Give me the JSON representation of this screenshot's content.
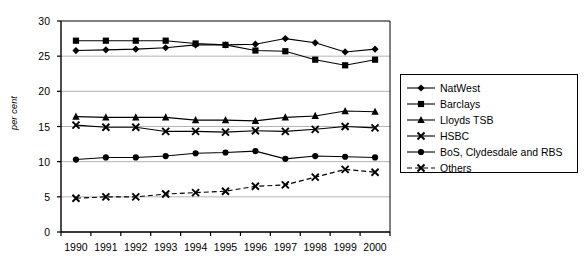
{
  "chart_data": {
    "type": "line",
    "title": "",
    "xlabel": "",
    "ylabel": "per cent",
    "categories": [
      "1990",
      "1991",
      "1992",
      "1993",
      "1994",
      "1995",
      "1996",
      "1997",
      "1998",
      "1999",
      "2000"
    ],
    "ylim": [
      0,
      30
    ],
    "yticks": [
      0,
      5,
      10,
      15,
      20,
      25,
      30
    ],
    "grid": true,
    "legend_position": "right",
    "series": [
      {
        "name": "NatWest",
        "marker": "diamond",
        "line_style": "solid",
        "color": "#000000",
        "values": [
          25.8,
          25.9,
          26.0,
          26.2,
          26.6,
          26.6,
          26.7,
          27.5,
          26.9,
          25.6,
          26.0
        ]
      },
      {
        "name": "Barclays",
        "marker": "square",
        "line_style": "solid",
        "color": "#000000",
        "values": [
          27.2,
          27.2,
          27.2,
          27.2,
          26.8,
          26.6,
          25.8,
          25.7,
          24.5,
          23.7,
          24.5
        ]
      },
      {
        "name": "Lloyds TSB",
        "marker": "triangle",
        "line_style": "solid",
        "color": "#000000",
        "values": [
          16.4,
          16.3,
          16.3,
          16.3,
          15.9,
          15.9,
          15.8,
          16.3,
          16.5,
          17.2,
          17.1
        ]
      },
      {
        "name": "HSBC",
        "marker": "cross",
        "line_style": "solid",
        "color": "#000000",
        "values": [
          15.2,
          14.9,
          14.9,
          14.3,
          14.3,
          14.2,
          14.4,
          14.3,
          14.6,
          15.0,
          14.8
        ]
      },
      {
        "name": "BoS, Clydesdale and RBS",
        "marker": "circle",
        "line_style": "solid",
        "color": "#000000",
        "values": [
          10.3,
          10.6,
          10.6,
          10.8,
          11.2,
          11.3,
          11.5,
          10.4,
          10.8,
          10.7,
          10.6
        ]
      },
      {
        "name": "Others",
        "marker": "cross",
        "line_style": "dashed",
        "color": "#000000",
        "values": [
          4.8,
          5.0,
          5.0,
          5.4,
          5.6,
          5.8,
          6.5,
          6.7,
          7.8,
          8.9,
          8.5
        ]
      }
    ]
  },
  "axes": {
    "y_axis_title": "per cent",
    "y_tick_labels": [
      "30",
      "25",
      "20",
      "15",
      "10",
      "5",
      "0"
    ],
    "x_tick_labels": [
      "1990",
      "1991",
      "1992",
      "1993",
      "1994",
      "1995",
      "1996",
      "1997",
      "1998",
      "1999",
      "2000"
    ]
  },
  "legend": {
    "entries": [
      {
        "label": "NatWest",
        "marker": "diamond-marker",
        "dashed": false
      },
      {
        "label": "Barclays",
        "marker": "square-marker",
        "dashed": false
      },
      {
        "label": "Lloyds TSB",
        "marker": "triangle-marker",
        "dashed": false
      },
      {
        "label": "HSBC",
        "marker": "cross-marker",
        "dashed": false
      },
      {
        "label": "BoS, Clydesdale and RBS",
        "marker": "circle-marker",
        "dashed": false
      },
      {
        "label": "Others",
        "marker": "cross-marker",
        "dashed": true
      }
    ]
  },
  "style": {
    "grid_color": "#b4b4b4",
    "frame_color": "#000000",
    "plot_background": "#ffffff"
  }
}
